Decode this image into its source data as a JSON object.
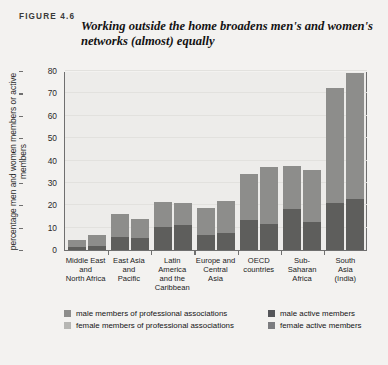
{
  "figure": {
    "number_label": "FIGURE 4.6",
    "title": "Working outside the home broadens men's and women's networks (almost) equally"
  },
  "chart_data": {
    "type": "bar",
    "stacked": true,
    "grouped": true,
    "title": "Working outside the home broadens men's and women's networks (almost) equally",
    "xlabel": "",
    "ylabel": "percentage men and women members or active members",
    "ylim": [
      0,
      80
    ],
    "yticks": [
      0,
      10,
      20,
      30,
      40,
      50,
      60,
      70,
      80
    ],
    "grid": true,
    "legend_position": "bottom",
    "categories": [
      "Middle East and North Africa",
      "East Asia and Pacific",
      "Latin America and the Caribbean",
      "Europe and Central Asia",
      "OECD countries",
      "Sub-Saharan Africa",
      "South Asia (India)"
    ],
    "category_lines": [
      [
        "Middle East",
        "and",
        "North Africa"
      ],
      [
        "East Asia",
        "and",
        "Pacific"
      ],
      [
        "Latin",
        "America",
        "and the",
        "Caribbean"
      ],
      [
        "Europe and",
        "Central",
        "Asia"
      ],
      [
        "OECD",
        "countries"
      ],
      [
        "Sub-Saharan",
        "Africa"
      ],
      [
        "South",
        "Asia",
        "(India)"
      ]
    ],
    "series": [
      {
        "name": "male active members",
        "bar": "male",
        "segment": "bottom",
        "color": "#5e5e5c",
        "values": [
          1.3,
          5.8,
          10.5,
          6.6,
          13.3,
          18.3,
          21.0
        ]
      },
      {
        "name": "male members of professional associations",
        "bar": "male",
        "segment": "top",
        "color": "#8d8d8b",
        "values": [
          3.0,
          10.2,
          11.0,
          12.4,
          20.7,
          19.2,
          51.5
        ]
      },
      {
        "name": "female active members",
        "bar": "female",
        "segment": "bottom",
        "color": "#5e5e5c",
        "values": [
          1.7,
          5.3,
          11.0,
          7.4,
          11.8,
          12.6,
          22.8
        ]
      },
      {
        "name": "female members of professional associations",
        "bar": "female",
        "segment": "top",
        "color": "#8d8d8b",
        "values": [
          4.8,
          8.7,
          10.0,
          14.7,
          25.4,
          23.0,
          56.2
        ]
      }
    ],
    "totals": {
      "male": [
        4.3,
        16.0,
        21.5,
        19.0,
        34.0,
        37.5,
        72.5
      ],
      "female": [
        6.5,
        14.0,
        21.0,
        22.1,
        37.2,
        35.6,
        79.0
      ]
    }
  },
  "legend": {
    "items": [
      {
        "label": "male members of professional associations",
        "swatch_class": "sw-male-prof",
        "color": "#8d8d8b"
      },
      {
        "label": "male active members",
        "swatch_class": "sw-male-act",
        "color": "#55565a"
      },
      {
        "label": "female members of professional associations",
        "swatch_class": "sw-female-prof",
        "color": "#b6b6b3"
      },
      {
        "label": "female active members",
        "swatch_class": "sw-female-act",
        "color": "#7c7d80"
      }
    ]
  }
}
